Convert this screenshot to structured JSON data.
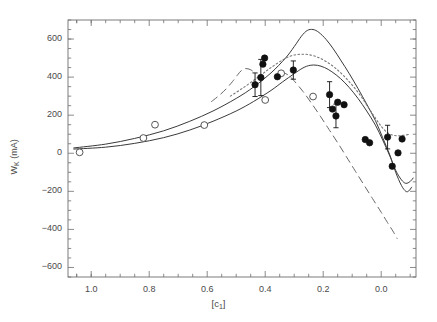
{
  "chart_data": {
    "type": "scatter",
    "title": "",
    "xlabel": "[c_1]",
    "ylabel": "W_K (mA)",
    "xlim": [
      1.08,
      -0.12
    ],
    "ylim": [
      -650,
      700
    ],
    "x_reversed": true,
    "grid": false,
    "legend": "none",
    "xticks": [
      1.0,
      0.8,
      0.6,
      0.4,
      0.2,
      0.0
    ],
    "xticklabels": [
      "1.0",
      "0.8",
      "0.6",
      "0.4",
      "0.2",
      "0.0"
    ],
    "x_minor_per_major": 4,
    "yticks": [
      600,
      400,
      200,
      0,
      -200,
      -400,
      -600
    ],
    "yticklabels": [
      "600",
      "400",
      "200",
      "0",
      "-200",
      "-400",
      "-600"
    ],
    "y_minor_per_major": 4,
    "series": [
      {
        "name": "open-circles",
        "type": "scatter",
        "marker": "open-circle",
        "color": "#555555",
        "points": [
          {
            "x": 1.04,
            "y": 5
          },
          {
            "x": 0.82,
            "y": 80
          },
          {
            "x": 0.78,
            "y": 150
          },
          {
            "x": 0.61,
            "y": 148
          },
          {
            "x": 0.4,
            "y": 280
          },
          {
            "x": 0.345,
            "y": 420
          },
          {
            "x": 0.235,
            "y": 298
          }
        ]
      },
      {
        "name": "filled-circles",
        "type": "scatter",
        "marker": "filled-circle",
        "color": "#111111",
        "points": [
          {
            "x": 0.435,
            "y": 360,
            "yerr": 62
          },
          {
            "x": 0.415,
            "y": 398,
            "yerr": 95
          },
          {
            "x": 0.408,
            "y": 468,
            "yerr": 0
          },
          {
            "x": 0.402,
            "y": 500,
            "yerr": 0
          },
          {
            "x": 0.358,
            "y": 402,
            "yerr": 0
          },
          {
            "x": 0.303,
            "y": 437,
            "yerr": 48
          },
          {
            "x": 0.178,
            "y": 308,
            "yerr": 68
          },
          {
            "x": 0.168,
            "y": 232,
            "yerr": 0
          },
          {
            "x": 0.156,
            "y": 196,
            "yerr": 62
          },
          {
            "x": 0.15,
            "y": 268,
            "yerr": 0
          },
          {
            "x": 0.128,
            "y": 255,
            "yerr": 0
          },
          {
            "x": 0.055,
            "y": 72,
            "yerr": 0
          },
          {
            "x": 0.04,
            "y": 55,
            "yerr": 0
          },
          {
            "x": -0.022,
            "y": 85,
            "yerr": 62
          },
          {
            "x": -0.038,
            "y": -68,
            "yerr": 0
          },
          {
            "x": -0.058,
            "y": 2,
            "yerr": 0
          },
          {
            "x": -0.072,
            "y": 75,
            "yerr": 0
          }
        ]
      },
      {
        "name": "solid-curve-upper",
        "type": "line",
        "style": "solid",
        "color": "#3a3a3a",
        "points": [
          {
            "x": 1.06,
            "y": 28
          },
          {
            "x": 0.95,
            "y": 48
          },
          {
            "x": 0.85,
            "y": 78
          },
          {
            "x": 0.75,
            "y": 118
          },
          {
            "x": 0.66,
            "y": 168
          },
          {
            "x": 0.58,
            "y": 222
          },
          {
            "x": 0.5,
            "y": 288
          },
          {
            "x": 0.44,
            "y": 348
          },
          {
            "x": 0.38,
            "y": 422
          },
          {
            "x": 0.33,
            "y": 500
          },
          {
            "x": 0.3,
            "y": 560
          },
          {
            "x": 0.275,
            "y": 615
          },
          {
            "x": 0.255,
            "y": 645
          },
          {
            "x": 0.235,
            "y": 650
          },
          {
            "x": 0.215,
            "y": 635
          },
          {
            "x": 0.19,
            "y": 598
          },
          {
            "x": 0.165,
            "y": 548
          },
          {
            "x": 0.14,
            "y": 490
          },
          {
            "x": 0.11,
            "y": 418
          },
          {
            "x": 0.08,
            "y": 340
          },
          {
            "x": 0.05,
            "y": 258
          },
          {
            "x": 0.02,
            "y": 172
          },
          {
            "x": -0.005,
            "y": 82
          },
          {
            "x": -0.03,
            "y": -10
          },
          {
            "x": -0.05,
            "y": -100
          },
          {
            "x": -0.07,
            "y": -170
          },
          {
            "x": -0.085,
            "y": -200
          },
          {
            "x": -0.095,
            "y": -198
          },
          {
            "x": -0.105,
            "y": -178
          }
        ]
      },
      {
        "name": "solid-curve-lower",
        "type": "line",
        "style": "solid",
        "color": "#3a3a3a",
        "points": [
          {
            "x": 1.06,
            "y": 22
          },
          {
            "x": 0.95,
            "y": 32
          },
          {
            "x": 0.85,
            "y": 52
          },
          {
            "x": 0.75,
            "y": 82
          },
          {
            "x": 0.66,
            "y": 122
          },
          {
            "x": 0.58,
            "y": 168
          },
          {
            "x": 0.5,
            "y": 222
          },
          {
            "x": 0.44,
            "y": 272
          },
          {
            "x": 0.38,
            "y": 330
          },
          {
            "x": 0.34,
            "y": 375
          },
          {
            "x": 0.3,
            "y": 418
          },
          {
            "x": 0.27,
            "y": 448
          },
          {
            "x": 0.245,
            "y": 462
          },
          {
            "x": 0.22,
            "y": 462
          },
          {
            "x": 0.195,
            "y": 450
          },
          {
            "x": 0.17,
            "y": 428
          },
          {
            "x": 0.14,
            "y": 392
          },
          {
            "x": 0.11,
            "y": 345
          },
          {
            "x": 0.08,
            "y": 288
          },
          {
            "x": 0.05,
            "y": 222
          },
          {
            "x": 0.02,
            "y": 148
          },
          {
            "x": -0.005,
            "y": 70
          },
          {
            "x": -0.03,
            "y": -15
          },
          {
            "x": -0.05,
            "y": -90
          },
          {
            "x": -0.07,
            "y": -140
          },
          {
            "x": -0.085,
            "y": -158
          },
          {
            "x": -0.1,
            "y": -148
          },
          {
            "x": -0.11,
            "y": -130
          }
        ]
      },
      {
        "name": "dotted-curve",
        "type": "line",
        "style": "dotted",
        "color": "#777777",
        "points": [
          {
            "x": 0.52,
            "y": 300
          },
          {
            "x": 0.47,
            "y": 350
          },
          {
            "x": 0.42,
            "y": 405
          },
          {
            "x": 0.38,
            "y": 450
          },
          {
            "x": 0.34,
            "y": 490
          },
          {
            "x": 0.31,
            "y": 512
          },
          {
            "x": 0.28,
            "y": 520
          },
          {
            "x": 0.25,
            "y": 518
          },
          {
            "x": 0.22,
            "y": 505
          },
          {
            "x": 0.19,
            "y": 482
          },
          {
            "x": 0.16,
            "y": 450
          },
          {
            "x": 0.13,
            "y": 408
          },
          {
            "x": 0.1,
            "y": 358
          },
          {
            "x": 0.07,
            "y": 300
          },
          {
            "x": 0.045,
            "y": 242
          },
          {
            "x": 0.02,
            "y": 185
          },
          {
            "x": 0.0,
            "y": 142
          },
          {
            "x": -0.02,
            "y": 110
          },
          {
            "x": -0.04,
            "y": 95
          },
          {
            "x": -0.06,
            "y": 92
          },
          {
            "x": -0.08,
            "y": 95
          },
          {
            "x": -0.1,
            "y": 100
          }
        ]
      },
      {
        "name": "dashed-line-steep",
        "type": "line",
        "style": "dashed",
        "color": "#666666",
        "points": [
          {
            "x": 0.345,
            "y": 430
          },
          {
            "x": 0.32,
            "y": 410
          },
          {
            "x": 0.3,
            "y": 380
          },
          {
            "x": 0.27,
            "y": 325
          },
          {
            "x": 0.24,
            "y": 262
          },
          {
            "x": 0.21,
            "y": 195
          },
          {
            "x": 0.18,
            "y": 125
          },
          {
            "x": 0.15,
            "y": 55
          },
          {
            "x": 0.12,
            "y": -18
          },
          {
            "x": 0.09,
            "y": -92
          },
          {
            "x": 0.06,
            "y": -165
          },
          {
            "x": 0.03,
            "y": -238
          },
          {
            "x": 0.0,
            "y": -310
          },
          {
            "x": -0.02,
            "y": -360
          },
          {
            "x": -0.04,
            "y": -408
          },
          {
            "x": -0.055,
            "y": -448
          }
        ]
      },
      {
        "name": "dashed-arc-short",
        "type": "line",
        "style": "dashed",
        "color": "#666666",
        "points": [
          {
            "x": 0.585,
            "y": 272
          },
          {
            "x": 0.56,
            "y": 302
          },
          {
            "x": 0.535,
            "y": 338
          },
          {
            "x": 0.512,
            "y": 378
          },
          {
            "x": 0.495,
            "y": 412
          },
          {
            "x": 0.482,
            "y": 435
          },
          {
            "x": 0.468,
            "y": 445
          },
          {
            "x": 0.452,
            "y": 440
          },
          {
            "x": 0.44,
            "y": 428
          }
        ]
      }
    ]
  },
  "axes": {
    "x_title_prefix": "[c",
    "x_title_sub": "1",
    "x_title_suffix": "]",
    "y_title_main": "W",
    "y_title_sub": "K",
    "y_title_units": " (mA)"
  }
}
